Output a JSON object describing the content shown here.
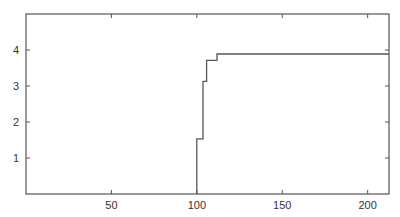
{
  "chart_data": {
    "type": "line",
    "subtype": "step",
    "title": "",
    "xlabel": "",
    "ylabel": "",
    "xlim": [
      0,
      212.5
    ],
    "ylim": [
      0,
      5
    ],
    "xticks": [
      50,
      100,
      150,
      200
    ],
    "yticks": [
      1,
      2,
      3,
      4
    ],
    "grid": false,
    "legend": null,
    "series": [
      {
        "name": "step",
        "color": "#555555",
        "x": [
          100,
          100,
          103.6,
          103.6,
          105.7,
          105.7,
          111.8,
          111.8,
          212.5
        ],
        "y": [
          0,
          1.53,
          1.53,
          3.13,
          3.13,
          3.71,
          3.71,
          3.89,
          3.89
        ]
      }
    ]
  }
}
